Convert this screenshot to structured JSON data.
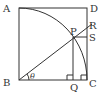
{
  "figure": {
    "type": "geometry-diagram",
    "points": {
      "A": {
        "label": "A"
      },
      "B": {
        "label": "B"
      },
      "C": {
        "label": "C"
      },
      "D": {
        "label": "D"
      },
      "P": {
        "label": "P"
      },
      "Q": {
        "label": "Q"
      },
      "R": {
        "label": "R"
      },
      "S": {
        "label": "S"
      }
    },
    "angle": {
      "label": "θ",
      "at": "B",
      "between": [
        "BC",
        "BP"
      ]
    },
    "right_angle_markers": [
      "Q",
      "C"
    ],
    "colors": {
      "stroke": "#333333",
      "background": "#ffffff"
    }
  }
}
